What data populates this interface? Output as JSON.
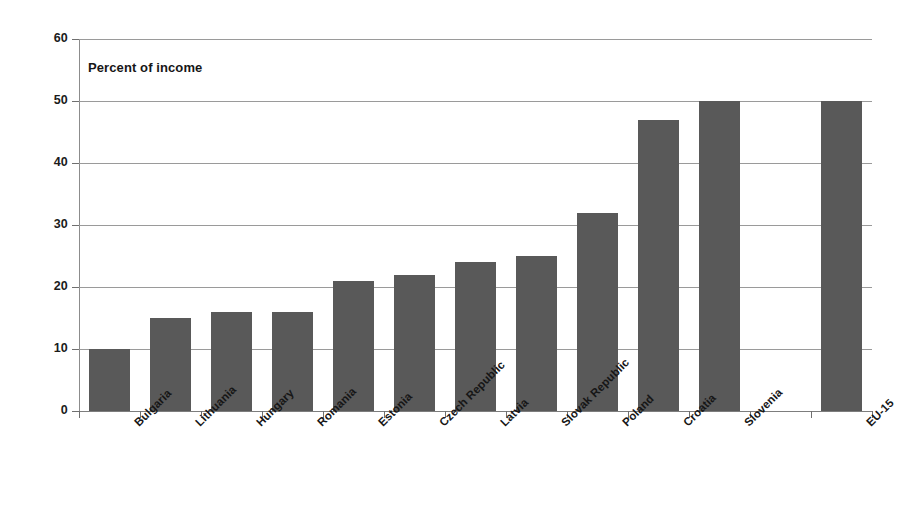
{
  "chart_data": {
    "type": "bar",
    "title": "",
    "subtitle": "",
    "annotation": "Percent of income",
    "xlabel": "",
    "ylabel": "",
    "ylim": [
      0,
      60
    ],
    "yticks": [
      0,
      10,
      20,
      30,
      40,
      50,
      60
    ],
    "ytick_labels": [
      "0",
      "10",
      "20",
      "30",
      "40",
      "50",
      "60"
    ],
    "grid": true,
    "legend": "none",
    "bar_color": "#595959",
    "gridline_color": "#9a9a9a",
    "axis_color": "#8c8c8c",
    "background": "#ffffff",
    "categories": [
      "Bulgaria",
      "Lithuania",
      "Hungary",
      "Romania",
      "Estonia",
      "Czech Republic",
      "Latvia",
      "Slovak Republic",
      "Poland",
      "Croatia",
      "Slovenia",
      "",
      "EU-15"
    ],
    "values": [
      10,
      15,
      16,
      16,
      21,
      22,
      24,
      25,
      32,
      47,
      50,
      null,
      50
    ]
  }
}
